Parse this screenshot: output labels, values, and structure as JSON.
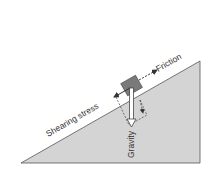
{
  "diagram": {
    "labels": {
      "friction": "Friction",
      "shearing_stress": "Shearing stress",
      "gravity": "Gravity"
    },
    "colors": {
      "slope_fill": "#d4d4d4",
      "slope_edge": "#555555",
      "block_fill": "#7a7a7a",
      "arrow": "#333333",
      "gravity_arrow_fill": "#ffffff"
    }
  }
}
